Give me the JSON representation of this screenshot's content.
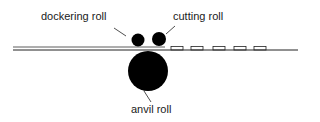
{
  "diagram": {
    "labels": {
      "dockering_roll": "dockering roll",
      "cutting_roll": "cutting roll",
      "anvil_roll": "anvil roll"
    },
    "colors": {
      "ink": "#000000",
      "line": "#222222",
      "background": "#ffffff"
    },
    "cut_pieces_count": 5
  }
}
